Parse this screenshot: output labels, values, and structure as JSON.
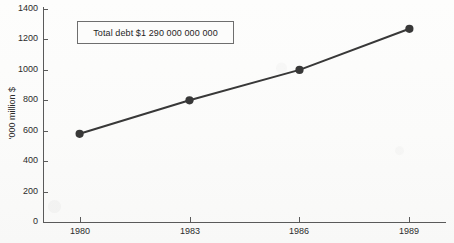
{
  "figure": {
    "cut_title_fragment": "",
    "background_color": "#fdfdfc",
    "axis_color": "#5a5a5a",
    "series_color": "#383838",
    "annotation_border_color": "#6e6e6e"
  },
  "chart_data": {
    "type": "line",
    "title": "",
    "xlabel": "",
    "ylabel": "'000 million $",
    "x": [
      1980,
      1983,
      1986,
      1989
    ],
    "xtick_labels": [
      "1980",
      "1983",
      "1986",
      "1989"
    ],
    "values": [
      580,
      800,
      1000,
      1270
    ],
    "series": [
      {
        "name": "Total debt",
        "values": [
          580,
          800,
          1000,
          1270
        ],
        "color": "#383838",
        "marker": "circle",
        "line_width": 2
      }
    ],
    "ylim": [
      0,
      1400
    ],
    "ytick_labels": [
      "0",
      "200",
      "400",
      "600",
      "800",
      "1000",
      "1200",
      "1400"
    ],
    "yticks": [
      0,
      200,
      400,
      600,
      800,
      1000,
      1200,
      1400
    ],
    "xlim": [
      1979.0,
      1990.0
    ],
    "grid": false,
    "legend": null,
    "annotations": [
      {
        "name": "total-debt-callout",
        "text": "Total debt $1 290 000 000 000"
      }
    ]
  }
}
